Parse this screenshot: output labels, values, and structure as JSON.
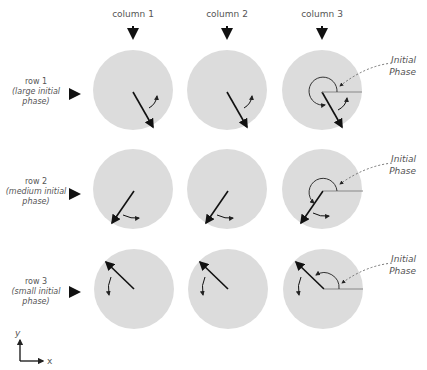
{
  "columns": [
    {
      "label": "column 1",
      "x": 133
    },
    {
      "label": "column 2",
      "x": 227
    },
    {
      "label": "column 3",
      "x": 322
    }
  ],
  "rows": [
    {
      "line1": "row 1",
      "line2": "(large initial",
      "line3": "phase)",
      "y": 90,
      "angle_deg": -62
    },
    {
      "line1": "row 2",
      "line2": "(medium initial",
      "line3": "phase)",
      "y": 190,
      "angle_deg": -125
    },
    {
      "line1": "row 3",
      "line2": "(small initial",
      "line3": "phase)",
      "y": 289,
      "angle_deg": 137
    }
  ],
  "annotation": {
    "line1": "Initial",
    "line2": "Phase"
  },
  "axes": {
    "y_label": "y",
    "x_label": "x"
  },
  "colors": {
    "circle": "#dcdcdc",
    "arrow": "#111111",
    "text": "#555555",
    "phase_line": "#888888"
  }
}
